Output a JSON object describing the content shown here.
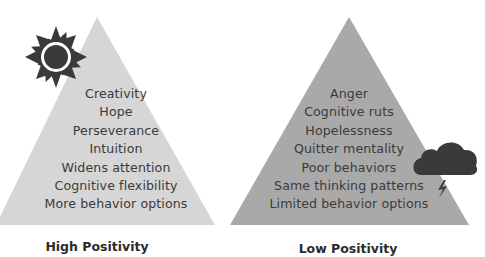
{
  "colors": {
    "high_triangle": "#d6d6d6",
    "low_triangle": "#a9a9a9",
    "icon": "#3a3a3a",
    "text": "#3b3b3b"
  },
  "high": {
    "caption": "High Positivity",
    "icon": "sun-icon",
    "items": [
      "Creativity",
      "Hope",
      "Perseverance",
      "Intuition",
      "Widens attention",
      "Cognitive flexibility",
      "More behavior options"
    ]
  },
  "low": {
    "caption": "Low Positivity",
    "icon": "storm-cloud-icon",
    "items": [
      "Anger",
      "Cognitive ruts",
      "Hopelessness",
      "Quitter mentality",
      "Poor behaviors",
      "Same thinking patterns",
      "Limited behavior options"
    ]
  }
}
